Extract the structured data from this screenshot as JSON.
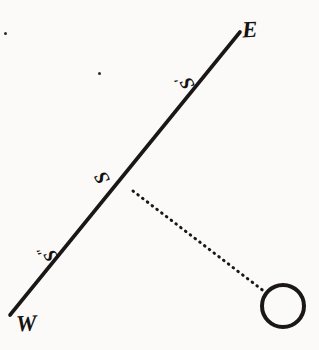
{
  "figure": {
    "background_color": "#fbfaf8",
    "ink_color": "#1a1816",
    "width": 319,
    "height": 350
  },
  "labels": {
    "east": "E",
    "west": "W",
    "station": "S",
    "station_prime": "S",
    "station_prime_mark": "′",
    "station_double_prime": "S",
    "station_double_prime_mark": "″"
  },
  "chart_data": {
    "type": "diagram",
    "elements": [
      {
        "name": "horizon-line",
        "kind": "line",
        "style": "solid",
        "from": [
          10,
          315
        ],
        "to": [
          240,
          32
        ],
        "stroke": "#1a1816",
        "stroke_width": 3.6,
        "endpoint_labels": [
          "W",
          "E"
        ]
      },
      {
        "name": "sight-ray",
        "kind": "line",
        "style": "dotted",
        "from": [
          133,
          191
        ],
        "to": [
          265,
          292
        ],
        "stroke": "#1a1816",
        "stroke_width": 3.0,
        "dot_spacing": 6
      },
      {
        "name": "celestial-body",
        "kind": "circle",
        "style": "open",
        "center": [
          283,
          306
        ],
        "radius": 21,
        "stroke": "#1a1816",
        "stroke_width": 4.0,
        "fill": "none"
      },
      {
        "name": "station-S",
        "kind": "point-label",
        "label": "S",
        "position": [
          104,
          178
        ]
      },
      {
        "name": "station-S-prime",
        "kind": "point-label",
        "label": "S′",
        "position": [
          186,
          81
        ]
      },
      {
        "name": "station-S-double-prime",
        "kind": "point-label",
        "label": "S″",
        "position": [
          47,
          252
        ]
      }
    ],
    "specks": [
      {
        "name": "speck-upper-left",
        "position": [
          4,
          32
        ],
        "size": 3
      },
      {
        "name": "speck-upper-mid",
        "position": [
          98,
          72
        ],
        "size": 3
      }
    ]
  }
}
